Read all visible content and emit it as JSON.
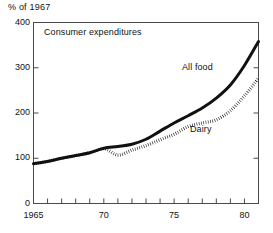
{
  "figure": {
    "unit_label": "% of 1967",
    "panel_title": "Consumer expenditures"
  },
  "chart_data": {
    "type": "line",
    "title": "Consumer expenditures",
    "ylabel": "% of 1967",
    "xlabel": "",
    "xlim": [
      1965,
      1981
    ],
    "ylim": [
      0,
      400
    ],
    "grid": false,
    "legend": "inline-labels",
    "y_ticks": [
      0,
      100,
      200,
      300,
      400
    ],
    "y_tick_labels": [
      "0",
      "100",
      "200",
      "300",
      "400"
    ],
    "x_ticks": [
      1965,
      1966,
      1967,
      1968,
      1969,
      1970,
      1971,
      1972,
      1973,
      1974,
      1975,
      1976,
      1977,
      1978,
      1979,
      1980,
      1981
    ],
    "x_tick_labels": [
      "1965",
      "",
      "",
      "",
      "",
      "70",
      "",
      "",
      "",
      "",
      "75",
      "",
      "",
      "",
      "",
      "80",
      ""
    ],
    "x": [
      1965,
      1966,
      1967,
      1968,
      1969,
      1970,
      1971,
      1972,
      1973,
      1974,
      1975,
      1976,
      1977,
      1978,
      1979,
      1980,
      1981
    ],
    "series": [
      {
        "name": "All food",
        "style": "solid",
        "label_text": "All food",
        "values": [
          88,
          93,
          100,
          106,
          112,
          122,
          126,
          131,
          142,
          160,
          178,
          194,
          211,
          233,
          262,
          305,
          358
        ]
      },
      {
        "name": "Dairy",
        "style": "dotted",
        "label_text": "Dairy",
        "values": [
          88,
          93,
          100,
          106,
          112,
          121,
          107,
          118,
          128,
          141,
          153,
          170,
          178,
          185,
          205,
          238,
          277
        ]
      }
    ]
  }
}
